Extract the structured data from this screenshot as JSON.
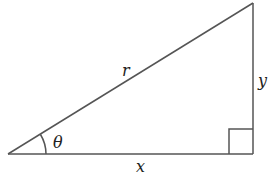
{
  "diagram": {
    "type": "right-triangle",
    "stroke_color": "#555555",
    "vertices": {
      "origin": [
        8,
        154
      ],
      "right_angle": [
        253,
        154
      ],
      "top": [
        253,
        3
      ]
    },
    "labels": {
      "hypotenuse": "r",
      "opposite": "y",
      "adjacent": "x",
      "angle": "θ"
    }
  }
}
